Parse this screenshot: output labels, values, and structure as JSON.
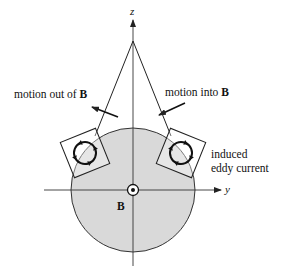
{
  "diagram": {
    "axes": {
      "z_label": "z",
      "y_label": "y"
    },
    "labels": {
      "motion_out_prefix": "motion out of ",
      "motion_out_bold": "B",
      "motion_into_prefix": "motion into ",
      "motion_into_bold": "B",
      "eddy_line1": "induced",
      "eddy_line2": "eddy current",
      "field_label": "B"
    },
    "colors": {
      "disk_fill": "#d9d9d9",
      "stroke": "#222222",
      "background": "#ffffff"
    },
    "elements": {
      "pendulum_strings": 2,
      "square_loops": 2,
      "field_symbol": "out-of-page (dot in circle)"
    }
  }
}
